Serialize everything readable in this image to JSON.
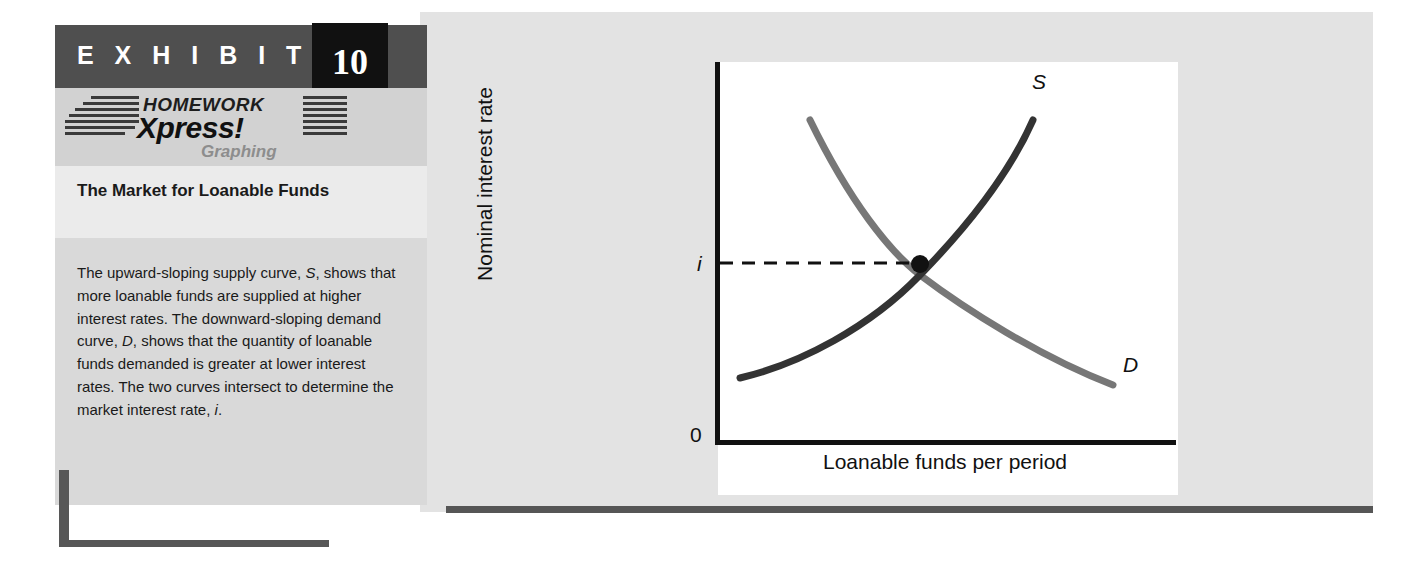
{
  "exhibit": {
    "header_label": "E X H I B I T",
    "number": "10",
    "logo": {
      "line1": "HOMEWORK",
      "line2": "Xpress!",
      "line3": "Graphing"
    },
    "title": "The Market for Loanable Funds",
    "caption": "The upward-sloping supply curve, S, shows that more loanable funds are supplied at higher interest rates. The downward-sloping demand curve, D, shows that the quantity of loanable funds demanded is greater at lower interest rates. The two curves intersect to determine the market interest rate, i."
  },
  "colors": {
    "header_band": "#4f4f4f",
    "number_box": "#111111",
    "logo_band": "#d2d2d2",
    "title_band": "#ebebeb",
    "caption_band": "#d9d9d9",
    "figure_panel": "#e3e3e3",
    "accent_bar": "#575757",
    "supply_curve": "#333333",
    "demand_curve": "#777777",
    "axis": "#111111"
  },
  "chart_data": {
    "type": "line",
    "title": "",
    "xlabel": "Loanable funds per period",
    "ylabel": "Nominal interest rate",
    "grid": false,
    "legend": "inline-curve-labels",
    "axis_origin_label": "0",
    "xlim": [
      0,
      100
    ],
    "ylim": [
      0,
      100
    ],
    "x_tick_labels": [],
    "y_tick_labels": [
      "0",
      "i"
    ],
    "annotations": [
      {
        "name": "equilibrium-point",
        "label": "i",
        "x": 54,
        "y": 55,
        "note": "Equilibrium interest rate where supply and demand intersect",
        "dashed_guide_to_axis": true
      }
    ],
    "series": [
      {
        "name": "Supply",
        "label": "S",
        "color": "#333333",
        "shape": "upward-sloping convex",
        "points": [
          {
            "x": 6,
            "y": 19
          },
          {
            "x": 20,
            "y": 27
          },
          {
            "x": 35,
            "y": 39
          },
          {
            "x": 54,
            "y": 55
          },
          {
            "x": 70,
            "y": 72
          },
          {
            "x": 80,
            "y": 87
          }
        ]
      },
      {
        "name": "Demand",
        "label": "D",
        "color": "#777777",
        "shape": "downward-sloping convex",
        "points": [
          {
            "x": 24,
            "y": 87
          },
          {
            "x": 34,
            "y": 73
          },
          {
            "x": 44,
            "y": 63
          },
          {
            "x": 54,
            "y": 55
          },
          {
            "x": 72,
            "y": 36
          },
          {
            "x": 97,
            "y": 19
          }
        ]
      }
    ]
  }
}
